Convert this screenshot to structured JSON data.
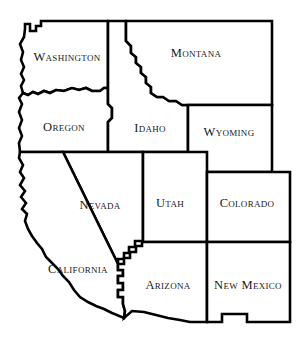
{
  "map": {
    "title": "Western United States Outline Map",
    "background_color": "#ffffff",
    "border_color": "#000000",
    "label_color": "#1a1a1a",
    "border_width": 2.6,
    "width": 306,
    "height": 356,
    "states": [
      {
        "id": "washington",
        "label": "Washington",
        "label_x": 67,
        "label_y": 57,
        "outline": "M 25,29 L 25,24 L 30,24 L 30,31 L 36,31 L 36,26 L 41,26 L 41,21 L 108,21 L 108,88 L 104,88 L 100,91 L 92,91 L 86,88 L 79,90 L 72,88 L 64,91 L 56,90 L 50,93 L 44,91 L 38,94 L 33,92 L 28,95 L 23,93 L 21,86 L 24,80 L 21,74 L 24,67 L 21,60 L 23,52 L 20,44 L 24,37 Z"
      },
      {
        "id": "oregon",
        "label": "Oregon",
        "label_x": 64,
        "label_y": 127,
        "outline": "M 23,93 L 28,95 L 33,92 L 38,94 L 44,91 L 50,93 L 56,90 L 64,91 L 72,88 L 79,90 L 86,88 L 92,91 L 100,91 L 104,88 L 108,88 L 108,104 L 112,108 L 112,118 L 108,122 L 108,152 L 20,152 L 19,143 L 22,136 L 19,128 L 22,120 L 19,112 L 22,104 L 19,98 Z"
      },
      {
        "id": "idaho",
        "label": "Idaho",
        "label_x": 150,
        "label_y": 128,
        "outline": "M 108,21 L 126,21 L 126,41 L 131,46 L 131,53 L 136,57 L 136,63 L 141,67 L 141,73 L 146,77 L 146,83 L 151,87 L 151,93 L 157,97 L 163,97 L 169,101 L 176,101 L 182,105 L 188,105 L 188,108 L 188,152 L 108,152 L 108,122 L 112,118 L 112,108 L 108,104 Z"
      },
      {
        "id": "montana",
        "label": "Montana",
        "label_x": 196,
        "label_y": 53,
        "outline": "M 126,21 L 272,21 L 272,105 L 188,105 L 182,105 L 176,101 L 169,101 L 163,97 L 157,97 L 151,93 L 151,87 L 146,83 L 146,77 L 141,73 L 141,67 L 136,63 L 136,57 L 131,53 L 131,46 L 126,41 Z"
      },
      {
        "id": "wyoming",
        "label": "Wyoming",
        "label_x": 229,
        "label_y": 132,
        "outline": "M 188,105 L 272,105 L 272,172 L 188,172 Z"
      },
      {
        "id": "nevada",
        "label": "Nevada",
        "label_x": 100,
        "label_y": 205,
        "outline": "M 63,152 L 143,152 L 143,241 L 135,241 L 135,247 L 129,247 L 129,253 L 124,253 L 124,259 L 118,259 L 118,264 Z"
      },
      {
        "id": "utah",
        "label": "Utah",
        "label_x": 170,
        "label_y": 203,
        "outline": "M 143,152 L 188,152 L 207,152 L 207,172 L 207,242 L 143,242 L 143,241 Z"
      },
      {
        "id": "colorado",
        "label": "Colorado",
        "label_x": 247,
        "label_y": 203,
        "outline": "M 207,172 L 290,172 L 290,242 L 207,242 Z"
      },
      {
        "id": "california",
        "label": "California",
        "label_x": 78,
        "label_y": 269,
        "outline": "M 20,152 L 63,152 L 118,264 L 118,270 L 123,270 L 123,276 L 118,276 L 118,283 L 123,283 L 123,290 L 118,290 L 118,297 L 123,297 L 123,304 L 125,311 L 124,318 L 112,313 L 104,309 L 96,306 L 88,302 L 80,297 L 74,290 L 69,282 L 63,276 L 58,269 L 52,263 L 46,257 L 42,249 L 37,243 L 32,236 L 28,229 L 25,221 L 27,214 L 22,209 L 26,203 L 21,197 L 25,191 L 20,185 L 24,178 L 20,172 L 23,165 L 19,158 Z"
      },
      {
        "id": "arizona",
        "label": "Arizona",
        "label_x": 168,
        "label_y": 285,
        "outline": "M 118,264 L 124,264 L 124,258 L 130,258 L 130,252 L 136,252 L 136,246 L 142,246 L 142,242 L 207,242 L 207,322 L 190,322 L 180,320 L 168,318 L 156,315 L 144,312 L 132,311 L 124,318 L 125,311 L 123,304 L 123,297 L 118,297 L 118,290 L 123,290 L 123,283 L 118,283 L 118,276 L 123,276 L 123,270 L 118,270 Z"
      },
      {
        "id": "new-mexico",
        "label": "New Mexico",
        "label_x": 248,
        "label_y": 285,
        "outline": "M 207,242 L 290,242 L 290,322 L 247,322 L 247,314 L 222,314 L 222,322 L 207,322 Z"
      }
    ]
  }
}
